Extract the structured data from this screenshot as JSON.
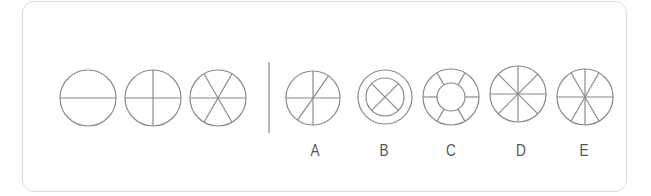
{
  "puzzle": {
    "stroke_color": "#8a8a8a",
    "divider_color": "#9a9a9a",
    "label_color": "#555555",
    "sequence": [
      {
        "name": "circle-one-diameter",
        "cx": 88,
        "cy": 98,
        "r": 28,
        "description": "circle with horizontal diameter (2 sections)"
      },
      {
        "name": "circle-two-diameters",
        "cx": 153,
        "cy": 98,
        "r": 28,
        "description": "circle with horizontal and vertical diameters (4 sections)"
      },
      {
        "name": "circle-three-diameters",
        "cx": 218,
        "cy": 98,
        "r": 28,
        "description": "circle with horizontal and two 60-degree diameters (6 sections)"
      }
    ],
    "options": [
      {
        "label": "A",
        "cx": 313,
        "cy": 98,
        "r": 27,
        "description": "circle with horizontal, vertical and one diagonal diameter"
      },
      {
        "label": "B",
        "cx": 385,
        "cy": 97,
        "r": 27,
        "inner_r": 19,
        "description": "double ring with X inside inner circle"
      },
      {
        "label": "C",
        "cx": 451,
        "cy": 97,
        "r": 28,
        "inner_r": 14,
        "description": "ring with inner circle and 6 spokes between"
      },
      {
        "label": "D",
        "cx": 518,
        "cy": 94,
        "r": 28,
        "description": "circle with 4 diameters at 45-degree steps (8 sections)"
      },
      {
        "label": "E",
        "cx": 585,
        "cy": 97,
        "r": 28,
        "description": "circle with horizontal, vertical and two 60-degree diameters (8 sections)"
      }
    ]
  }
}
